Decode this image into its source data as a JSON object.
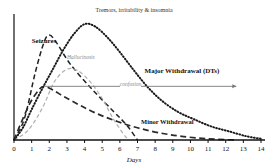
{
  "chart_data": {
    "type": "line",
    "xlabel": "Days",
    "ylabel": "",
    "xlim": [
      0,
      14
    ],
    "ylim": [
      0,
      1
    ],
    "grid": false,
    "legend_position": "inline-annotations",
    "x_ticks": [
      "0",
      "1",
      "2",
      "3",
      "4",
      "5",
      "6",
      "7",
      "8",
      "9",
      "10",
      "11",
      "12",
      "13",
      "14"
    ],
    "series": [
      {
        "name": "Seizures",
        "style": "dashed",
        "color": "#222222",
        "label": "Seizures",
        "label_x": 1.0,
        "label_y": 0.8,
        "bold": true,
        "points": [
          {
            "x": 0.0,
            "y": 0.0
          },
          {
            "x": 0.6,
            "y": 0.18
          },
          {
            "x": 1.2,
            "y": 0.55
          },
          {
            "x": 1.7,
            "y": 0.8
          },
          {
            "x": 2.0,
            "y": 0.86
          },
          {
            "x": 2.4,
            "y": 0.8
          },
          {
            "x": 3.2,
            "y": 0.62
          },
          {
            "x": 4.4,
            "y": 0.42
          },
          {
            "x": 5.6,
            "y": 0.24
          },
          {
            "x": 6.4,
            "y": 0.12
          },
          {
            "x": 7.0,
            "y": 0.0
          }
        ]
      },
      {
        "name": "Hallucinosis",
        "style": "dashed-light",
        "color": "#b0b0b0",
        "label": "Hallucinosis",
        "label_x": 3.0,
        "label_y": 0.66,
        "bold": false,
        "points": [
          {
            "x": 0.0,
            "y": 0.0
          },
          {
            "x": 0.8,
            "y": 0.08
          },
          {
            "x": 1.6,
            "y": 0.26
          },
          {
            "x": 2.3,
            "y": 0.48
          },
          {
            "x": 3.0,
            "y": 0.58
          },
          {
            "x": 3.6,
            "y": 0.57
          },
          {
            "x": 4.3,
            "y": 0.48
          },
          {
            "x": 5.0,
            "y": 0.34
          },
          {
            "x": 5.6,
            "y": 0.18
          },
          {
            "x": 6.2,
            "y": 0.05
          },
          {
            "x": 6.5,
            "y": 0.0
          }
        ]
      },
      {
        "name": "Major Withdrawal (DTs)",
        "style": "dotted",
        "color": "#1a1a1a",
        "label": "Major Withdrawal (DTs)",
        "label_x": 7.4,
        "label_y": 0.56,
        "bold": true,
        "points": [
          {
            "x": 0.0,
            "y": 0.0
          },
          {
            "x": 0.5,
            "y": 0.1
          },
          {
            "x": 1.0,
            "y": 0.25
          },
          {
            "x": 1.6,
            "y": 0.42
          },
          {
            "x": 2.2,
            "y": 0.58
          },
          {
            "x": 2.8,
            "y": 0.74
          },
          {
            "x": 3.4,
            "y": 0.87
          },
          {
            "x": 4.0,
            "y": 0.95
          },
          {
            "x": 4.6,
            "y": 0.93
          },
          {
            "x": 5.3,
            "y": 0.84
          },
          {
            "x": 6.0,
            "y": 0.72
          },
          {
            "x": 6.8,
            "y": 0.57
          },
          {
            "x": 7.6,
            "y": 0.43
          },
          {
            "x": 8.4,
            "y": 0.32
          },
          {
            "x": 9.3,
            "y": 0.23
          },
          {
            "x": 10.2,
            "y": 0.17
          },
          {
            "x": 11.2,
            "y": 0.11
          },
          {
            "x": 12.2,
            "y": 0.07
          },
          {
            "x": 13.2,
            "y": 0.03
          },
          {
            "x": 14.0,
            "y": 0.01
          }
        ]
      },
      {
        "name": "Minor Withdrawal",
        "style": "long-dashed",
        "color": "#2a2a2a",
        "label": "Minor Withdrawal",
        "label_x": 7.2,
        "label_y": 0.14,
        "bold": true,
        "points": [
          {
            "x": 0.0,
            "y": 0.0
          },
          {
            "x": 0.4,
            "y": 0.14
          },
          {
            "x": 0.9,
            "y": 0.3
          },
          {
            "x": 1.4,
            "y": 0.41
          },
          {
            "x": 1.7,
            "y": 0.44
          },
          {
            "x": 2.2,
            "y": 0.41
          },
          {
            "x": 2.9,
            "y": 0.35
          },
          {
            "x": 3.8,
            "y": 0.28
          },
          {
            "x": 4.8,
            "y": 0.21
          },
          {
            "x": 5.9,
            "y": 0.15
          },
          {
            "x": 7.0,
            "y": 0.1
          },
          {
            "x": 8.2,
            "y": 0.06
          },
          {
            "x": 9.5,
            "y": 0.03
          },
          {
            "x": 11.0,
            "y": 0.01
          },
          {
            "x": 12.5,
            "y": 0.0
          }
        ]
      }
    ],
    "annotations": [
      {
        "name": "tremors-arrow",
        "text": "Tremors, irritability & insomnia",
        "arrow": "double",
        "x_start": 0.55,
        "x_end": 13.6,
        "y": 1.06
      },
      {
        "name": "confusion-arrow",
        "text": "confusion",
        "arrow": "right",
        "x_start": 1.7,
        "x_end": 12.6,
        "y": 0.44
      }
    ]
  },
  "axis": {
    "x_title": "Days",
    "ticks": [
      "0",
      "1",
      "2",
      "3",
      "4",
      "5",
      "6",
      "7",
      "8",
      "9",
      "10",
      "11",
      "12",
      "13",
      "14"
    ]
  },
  "labels": {
    "seizures": "Seizures",
    "hallucinosis": "Hallucinosis",
    "major": "Major Withdrawal (DTs)",
    "minor": "Minor Withdrawal",
    "tremors": "Tremors, irritability & insomnia",
    "confusion": "confusion"
  },
  "colors": {
    "axis": "#111111",
    "dts": "#1a1a1a",
    "seizures": "#222222",
    "hallucinosis": "#b0b0b0",
    "minor": "#2a2a2a",
    "annotation": "#777777"
  }
}
